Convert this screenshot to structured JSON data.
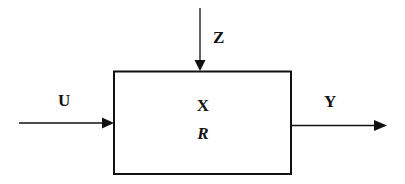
{
  "diagram": {
    "type": "block-diagram",
    "block": {
      "state_label": "X",
      "parameter_label": "R"
    },
    "inputs": [
      {
        "label": "U",
        "direction": "left-to-block"
      },
      {
        "label": "Z",
        "direction": "top-to-block"
      }
    ],
    "outputs": [
      {
        "label": "Y",
        "direction": "block-to-right"
      }
    ],
    "colors": {
      "stroke": "#111111",
      "background": "#ffffff"
    }
  }
}
